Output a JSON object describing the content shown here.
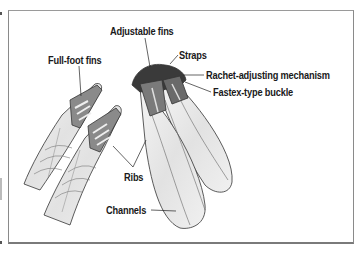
{
  "figure": {
    "labels": {
      "adjustable_fins": "Adjustable fins",
      "straps": "Straps",
      "rachet": "Rachet-adjusting mechanism",
      "fastex": "Fastex-type buckle",
      "full_foot_fins": "Full-foot fins",
      "ribs": "Ribs",
      "channels": "Channels"
    },
    "colors": {
      "text": "#1a1a1a",
      "frame": "#8a8a8a",
      "background": "#ffffff"
    }
  }
}
